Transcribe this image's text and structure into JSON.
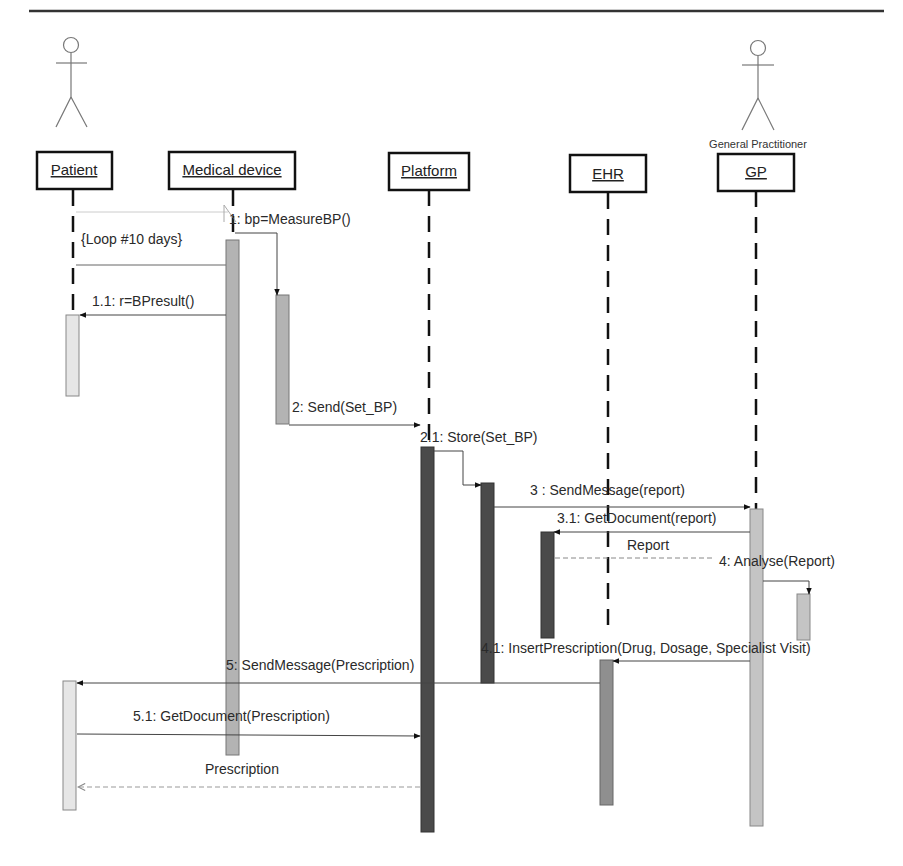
{
  "diagram": {
    "type": "UML sequence diagram",
    "actors": [
      {
        "id": "patient",
        "caption": ""
      },
      {
        "id": "gp",
        "caption": "General Practitioner"
      }
    ],
    "lifelines": [
      {
        "id": "patient",
        "label": "Patient"
      },
      {
        "id": "medical_device",
        "label": "Medical device"
      },
      {
        "id": "platform",
        "label": "Platform"
      },
      {
        "id": "ehr",
        "label": "EHR"
      },
      {
        "id": "gp",
        "label": "GP"
      }
    ],
    "loop": {
      "label": "{Loop  #10 days}"
    },
    "messages": [
      {
        "id": "m1",
        "label": "1: bp=MeasureBP()",
        "from": "medical_device",
        "to": "medical_device",
        "style": "sync"
      },
      {
        "id": "m1_1",
        "label": "1.1: r=BPresult()",
        "from": "medical_device",
        "to": "patient",
        "style": "sync"
      },
      {
        "id": "m2",
        "label": "2: Send(Set_BP)",
        "from": "medical_device",
        "to": "platform",
        "style": "sync"
      },
      {
        "id": "m2_1",
        "label": "2.1: Store(Set_BP)",
        "from": "platform",
        "to": "platform",
        "style": "sync"
      },
      {
        "id": "m3",
        "label": "3 : SendMessage(report)",
        "from": "platform",
        "to": "gp",
        "style": "sync"
      },
      {
        "id": "m3_1",
        "label": "3.1: GetDocument(report)",
        "from": "gp",
        "to": "platform",
        "style": "sync"
      },
      {
        "id": "r_report",
        "label": "Report",
        "from": "platform",
        "to": "gp",
        "style": "return"
      },
      {
        "id": "m4",
        "label": "4: Analyse(Report)",
        "from": "gp",
        "to": "gp",
        "style": "sync"
      },
      {
        "id": "m4_1",
        "label": "4.1: InsertPrescription(Drug, Dosage, Specialist Visit)",
        "from": "gp",
        "to": "ehr",
        "style": "sync"
      },
      {
        "id": "m5",
        "label": "5: SendMessage(Prescription)",
        "from": "ehr",
        "to": "patient",
        "style": "sync"
      },
      {
        "id": "m5_1",
        "label": "5.1: GetDocument(Prescription)",
        "from": "patient",
        "to": "platform",
        "style": "sync"
      },
      {
        "id": "r_prescription",
        "label": "Prescription",
        "from": "platform",
        "to": "patient",
        "style": "return"
      }
    ]
  }
}
